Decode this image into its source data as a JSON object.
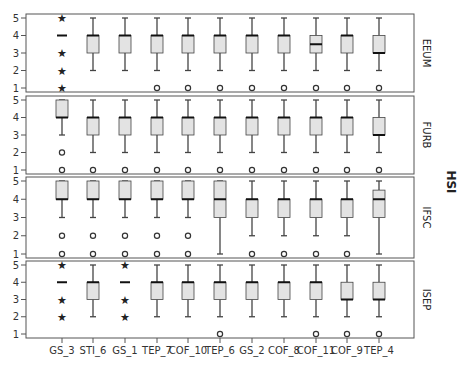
{
  "chart_data": {
    "type": "boxplot",
    "title": "",
    "ylabel": "HSI",
    "xlabel": "",
    "ylim": [
      1,
      5
    ],
    "yticks": [
      1,
      2,
      3,
      4,
      5
    ],
    "grid": false,
    "categories": [
      "GS_3",
      "STI_6",
      "GS_1",
      "TEP_7",
      "COF_10",
      "TEP_6",
      "GS_2",
      "COF_8",
      "COF_11",
      "COF_9",
      "TEP_4"
    ],
    "panels": [
      {
        "name": "EEUM",
        "boxes": [
          {
            "cat": "GS_3",
            "median": 4,
            "q1": 4,
            "q3": 4,
            "whislo": 4,
            "whishi": 4,
            "outliers": [],
            "extremes": [
              1,
              2,
              3,
              5
            ]
          },
          {
            "cat": "STI_6",
            "median": 4,
            "q1": 3,
            "q3": 4,
            "whislo": 2,
            "whishi": 5,
            "outliers": [],
            "extremes": []
          },
          {
            "cat": "GS_1",
            "median": 4,
            "q1": 3,
            "q3": 4,
            "whislo": 2,
            "whishi": 5,
            "outliers": [],
            "extremes": []
          },
          {
            "cat": "TEP_7",
            "median": 4,
            "q1": 3,
            "q3": 4,
            "whislo": 2,
            "whishi": 5,
            "outliers": [
              1
            ],
            "extremes": []
          },
          {
            "cat": "COF_10",
            "median": 4,
            "q1": 3,
            "q3": 4,
            "whislo": 2,
            "whishi": 5,
            "outliers": [
              1
            ],
            "extremes": []
          },
          {
            "cat": "TEP_6",
            "median": 4,
            "q1": 3,
            "q3": 4,
            "whislo": 2,
            "whishi": 5,
            "outliers": [
              1
            ],
            "extremes": []
          },
          {
            "cat": "GS_2",
            "median": 4,
            "q1": 3,
            "q3": 4,
            "whislo": 2,
            "whishi": 5,
            "outliers": [
              1
            ],
            "extremes": []
          },
          {
            "cat": "COF_8",
            "median": 4,
            "q1": 3,
            "q3": 4,
            "whislo": 2,
            "whishi": 5,
            "outliers": [
              1
            ],
            "extremes": []
          },
          {
            "cat": "COF_11",
            "median": 3.5,
            "q1": 3,
            "q3": 4,
            "whislo": 2,
            "whishi": 5,
            "outliers": [
              1
            ],
            "extremes": []
          },
          {
            "cat": "COF_9",
            "median": 4,
            "q1": 3,
            "q3": 4,
            "whislo": 2,
            "whishi": 5,
            "outliers": [
              1
            ],
            "extremes": []
          },
          {
            "cat": "TEP_4",
            "median": 3,
            "q1": 3,
            "q3": 4,
            "whislo": 2,
            "whishi": 5,
            "outliers": [
              1
            ],
            "extremes": []
          }
        ]
      },
      {
        "name": "FURB",
        "boxes": [
          {
            "cat": "GS_3",
            "median": 4,
            "q1": 4,
            "q3": 5,
            "whislo": 3,
            "whishi": 5,
            "outliers": [
              1,
              2
            ],
            "extremes": []
          },
          {
            "cat": "STI_6",
            "median": 4,
            "q1": 3,
            "q3": 4,
            "whislo": 2,
            "whishi": 5,
            "outliers": [
              1
            ],
            "extremes": []
          },
          {
            "cat": "GS_1",
            "median": 4,
            "q1": 3,
            "q3": 4,
            "whislo": 2,
            "whishi": 5,
            "outliers": [
              1
            ],
            "extremes": []
          },
          {
            "cat": "TEP_7",
            "median": 4,
            "q1": 3,
            "q3": 4,
            "whislo": 2,
            "whishi": 5,
            "outliers": [
              1
            ],
            "extremes": []
          },
          {
            "cat": "COF_10",
            "median": 4,
            "q1": 3,
            "q3": 4,
            "whislo": 2,
            "whishi": 5,
            "outliers": [
              1
            ],
            "extremes": []
          },
          {
            "cat": "TEP_6",
            "median": 4,
            "q1": 3,
            "q3": 4,
            "whislo": 2,
            "whishi": 5,
            "outliers": [
              1
            ],
            "extremes": []
          },
          {
            "cat": "GS_2",
            "median": 4,
            "q1": 3,
            "q3": 4,
            "whislo": 2,
            "whishi": 5,
            "outliers": [
              1
            ],
            "extremes": []
          },
          {
            "cat": "COF_8",
            "median": 4,
            "q1": 3,
            "q3": 4,
            "whislo": 2,
            "whishi": 5,
            "outliers": [
              1
            ],
            "extremes": []
          },
          {
            "cat": "COF_11",
            "median": 4,
            "q1": 3,
            "q3": 4,
            "whislo": 2,
            "whishi": 5,
            "outliers": [
              1
            ],
            "extremes": []
          },
          {
            "cat": "COF_9",
            "median": 4,
            "q1": 3,
            "q3": 4,
            "whislo": 2,
            "whishi": 5,
            "outliers": [
              1
            ],
            "extremes": []
          },
          {
            "cat": "TEP_4",
            "median": 3,
            "q1": 3,
            "q3": 4,
            "whislo": 2,
            "whishi": 5,
            "outliers": [
              1
            ],
            "extremes": []
          }
        ]
      },
      {
        "name": "IFSC",
        "boxes": [
          {
            "cat": "GS_3",
            "median": 4,
            "q1": 4,
            "q3": 5,
            "whislo": 3,
            "whishi": 5,
            "outliers": [
              1,
              2
            ],
            "extremes": []
          },
          {
            "cat": "STI_6",
            "median": 4,
            "q1": 4,
            "q3": 5,
            "whislo": 3,
            "whishi": 5,
            "outliers": [
              1,
              2
            ],
            "extremes": []
          },
          {
            "cat": "GS_1",
            "median": 4,
            "q1": 4,
            "q3": 5,
            "whislo": 3,
            "whishi": 5,
            "outliers": [
              1,
              2
            ],
            "extremes": []
          },
          {
            "cat": "TEP_7",
            "median": 4,
            "q1": 4,
            "q3": 5,
            "whislo": 3,
            "whishi": 5,
            "outliers": [
              1,
              2
            ],
            "extremes": []
          },
          {
            "cat": "COF_10",
            "median": 4,
            "q1": 4,
            "q3": 5,
            "whislo": 3,
            "whishi": 5,
            "outliers": [
              1,
              2
            ],
            "extremes": []
          },
          {
            "cat": "TEP_6",
            "median": 4,
            "q1": 3,
            "q3": 5,
            "whislo": 1,
            "whishi": 5,
            "outliers": [],
            "extremes": []
          },
          {
            "cat": "GS_2",
            "median": 4,
            "q1": 3,
            "q3": 4,
            "whislo": 2,
            "whishi": 5,
            "outliers": [
              1
            ],
            "extremes": []
          },
          {
            "cat": "COF_8",
            "median": 4,
            "q1": 3,
            "q3": 4,
            "whislo": 2,
            "whishi": 5,
            "outliers": [
              1
            ],
            "extremes": []
          },
          {
            "cat": "COF_11",
            "median": 4,
            "q1": 3,
            "q3": 4,
            "whislo": 2,
            "whishi": 5,
            "outliers": [
              1
            ],
            "extremes": []
          },
          {
            "cat": "COF_9",
            "median": 4,
            "q1": 3,
            "q3": 4,
            "whislo": 2,
            "whishi": 5,
            "outliers": [
              1
            ],
            "extremes": []
          },
          {
            "cat": "TEP_4",
            "median": 4,
            "q1": 3,
            "q3": 4.5,
            "whislo": 1,
            "whishi": 5,
            "outliers": [],
            "extremes": []
          }
        ]
      },
      {
        "name": "ISEP",
        "boxes": [
          {
            "cat": "GS_3",
            "median": 4,
            "q1": 4,
            "q3": 4,
            "whislo": 4,
            "whishi": 4,
            "outliers": [],
            "extremes": [
              2,
              3,
              5
            ]
          },
          {
            "cat": "STI_6",
            "median": 4,
            "q1": 3,
            "q3": 4,
            "whislo": 2,
            "whishi": 5,
            "outliers": [],
            "extremes": []
          },
          {
            "cat": "GS_1",
            "median": 4,
            "q1": 4,
            "q3": 4,
            "whislo": 4,
            "whishi": 4,
            "outliers": [],
            "extremes": [
              2,
              3,
              5
            ]
          },
          {
            "cat": "TEP_7",
            "median": 4,
            "q1": 3,
            "q3": 4,
            "whislo": 2,
            "whishi": 5,
            "outliers": [],
            "extremes": []
          },
          {
            "cat": "COF_10",
            "median": 4,
            "q1": 3,
            "q3": 4,
            "whislo": 2,
            "whishi": 5,
            "outliers": [],
            "extremes": []
          },
          {
            "cat": "TEP_6",
            "median": 4,
            "q1": 3,
            "q3": 4,
            "whislo": 2,
            "whishi": 5,
            "outliers": [
              1
            ],
            "extremes": []
          },
          {
            "cat": "GS_2",
            "median": 4,
            "q1": 3,
            "q3": 4,
            "whislo": 2,
            "whishi": 5,
            "outliers": [],
            "extremes": []
          },
          {
            "cat": "COF_8",
            "median": 4,
            "q1": 3,
            "q3": 4,
            "whislo": 2,
            "whishi": 5,
            "outliers": [],
            "extremes": []
          },
          {
            "cat": "COF_11",
            "median": 4,
            "q1": 3,
            "q3": 4,
            "whislo": 2,
            "whishi": 5,
            "outliers": [
              1
            ],
            "extremes": []
          },
          {
            "cat": "COF_9",
            "median": 3,
            "q1": 3,
            "q3": 4,
            "whislo": 2,
            "whishi": 5,
            "outliers": [
              1
            ],
            "extremes": []
          },
          {
            "cat": "TEP_4",
            "median": 3,
            "q1": 3,
            "q3": 4,
            "whislo": 2,
            "whishi": 5,
            "outliers": [
              1
            ],
            "extremes": []
          }
        ]
      }
    ],
    "colors": {
      "box_fill": "#e3e3e3",
      "box_stroke": "#444444",
      "median": "#111111",
      "whisker": "#444444",
      "frame": "#555555"
    }
  }
}
